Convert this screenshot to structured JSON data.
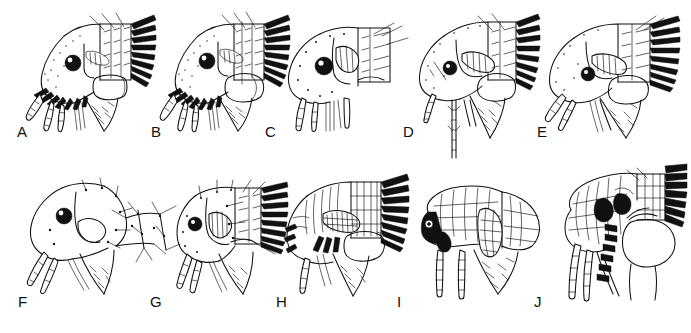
{
  "plate": {
    "title": "Flea head and pronotum morphology plate",
    "description": "Line drawings of lateral views of flea heads and prothoraces showing genal and pronotal combs, eyes, antennae and maxillary palps",
    "background_color": "#ffffff",
    "ink_color": "#111111",
    "rows": 2,
    "columns": 5,
    "panel_count": 10
  },
  "panels": [
    {
      "label": "A",
      "row": 1,
      "column": 1,
      "genal_comb": "present",
      "pronotal_comb": "present",
      "eye": "present"
    },
    {
      "label": "B",
      "row": 1,
      "column": 2,
      "genal_comb": "present",
      "pronotal_comb": "present",
      "eye": "present"
    },
    {
      "label": "C",
      "row": 1,
      "column": 3,
      "genal_comb": "absent",
      "pronotal_comb": "absent",
      "eye": "present"
    },
    {
      "label": "D",
      "row": 1,
      "column": 4,
      "genal_comb": "absent",
      "pronotal_comb": "present",
      "eye": "present"
    },
    {
      "label": "E",
      "row": 1,
      "column": 5,
      "genal_comb": "absent",
      "pronotal_comb": "present",
      "eye": "present"
    },
    {
      "label": "F",
      "row": 2,
      "column": 1,
      "genal_comb": "absent",
      "pronotal_comb": "absent",
      "eye": "present"
    },
    {
      "label": "G",
      "row": 2,
      "column": 2,
      "genal_comb": "absent",
      "pronotal_comb": "present",
      "eye": "present"
    },
    {
      "label": "H",
      "row": 2,
      "column": 3,
      "genal_comb": "present",
      "pronotal_comb": "present",
      "eye": "absent"
    },
    {
      "label": "I",
      "row": 2,
      "column": 4,
      "genal_comb": "present",
      "pronotal_comb": "absent",
      "eye": "present"
    },
    {
      "label": "J",
      "row": 2,
      "column": 5,
      "genal_comb": "present",
      "pronotal_comb": "present",
      "eye": "present"
    }
  ],
  "labels": {
    "a": "A",
    "b": "B",
    "c": "C",
    "d": "D",
    "e": "E",
    "f": "F",
    "g": "G",
    "h": "H",
    "i": "I",
    "j": "J"
  }
}
